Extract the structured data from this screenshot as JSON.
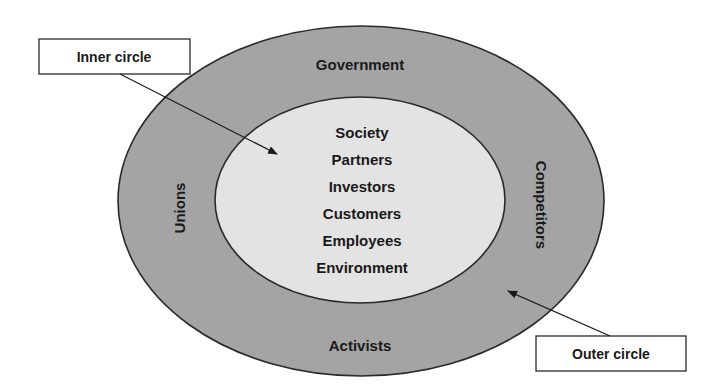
{
  "diagram": {
    "type": "concentric-ellipses",
    "outer": {
      "fill": "#a4a4a4",
      "stroke": "#2a2a2a",
      "labels": {
        "top": "Government",
        "bottom": "Activists",
        "left": "Unions",
        "right": "Competitors"
      }
    },
    "inner": {
      "fill": "#e3e3e3",
      "stroke": "#2a2a2a",
      "items": [
        "Society",
        "Partners",
        "Investors",
        "Customers",
        "Employees",
        "Environment"
      ]
    },
    "callouts": {
      "inner": {
        "label": "Inner circle"
      },
      "outer": {
        "label": "Outer circle"
      }
    }
  }
}
